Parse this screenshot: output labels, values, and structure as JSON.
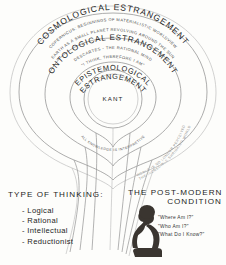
{
  "diagram": {
    "type": "concentric-estrangement",
    "rings": [
      {
        "id": "cosmological",
        "title": "COSMOLOGICAL ESTRANGEMENT",
        "subtitle_1": "COPERNICUS: BEGINNINGS OF MATERIALISTIC WORLDVIEW",
        "subtitle_2": "EARTH AS A SMALL PLANET REVOLVING AROUND THE SUN"
      },
      {
        "id": "ontological",
        "title": "ONTOLOGICAL ESTRANGEMENT",
        "subtitle_1": "DESCARTES - THE RATIONAL MIND",
        "subtitle_2": "\"I THINK, THEREFORE I AM\""
      },
      {
        "id": "epistemological",
        "title_line_1": "EPISTEMOLOGICAL",
        "title_line_2": "ESTRANGEMENT",
        "thinker": "KANT",
        "subtitle_1": "ALL KNOWLEDGE IS INTERPRETIVE"
      }
    ],
    "outer_arc_labels": [
      "THE INCREDIBLE SHRINKING WORLD",
      "WORLD IS NO LONGER PERCEIVED",
      "REALITY CANNOT BE APPREHENDED"
    ]
  },
  "bottom": {
    "left": {
      "heading": "TYPE OF THINKING:",
      "items": [
        "- Logical",
        "- Rational",
        "- Intellectual",
        "- Reductionist"
      ]
    },
    "right": {
      "heading_line_1": "THE POST-MODERN",
      "heading_line_2": "CONDITION",
      "questions": [
        "\"Where Am I?\"",
        "\"Who Am I?\"",
        "\"What Do I Know?\""
      ]
    }
  },
  "colors": {
    "background": "#fdfdfb",
    "ink": "#1f1f1f",
    "ring_stroke": "#8a8a8a",
    "faint": "#b4b4b4",
    "silhouette": "#3a3530"
  }
}
